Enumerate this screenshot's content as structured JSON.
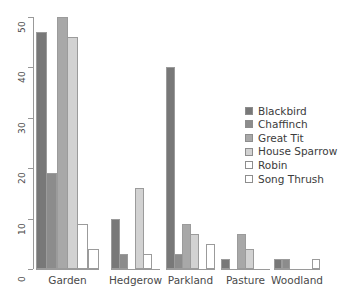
{
  "chart_data": {
    "type": "bar",
    "title": "",
    "subtitle": "",
    "xlabel": "",
    "ylabel": "",
    "categories": [
      "Garden",
      "Hedgerow",
      "Parkland",
      "Pasture",
      "Woodland"
    ],
    "series": [
      {
        "name": "Blackbird",
        "color": "#787878",
        "values": [
          47,
          10,
          40,
          2,
          2
        ]
      },
      {
        "name": "Chaffinch",
        "color": "#8c8c8c",
        "values": [
          19,
          3,
          3,
          0,
          2
        ]
      },
      {
        "name": "Great Tit",
        "color": "#a8a8a8",
        "values": [
          50,
          0,
          9,
          7,
          0
        ]
      },
      {
        "name": "House Sparrow",
        "color": "#d2d2d2",
        "values": [
          46,
          16,
          7,
          4,
          0
        ]
      },
      {
        "name": "Robin",
        "color": "#ffffff",
        "values": [
          9,
          3,
          0,
          0,
          0
        ]
      },
      {
        "name": "Song Thrush",
        "color": "#ffffff",
        "values": [
          4,
          0,
          5,
          0,
          2
        ]
      }
    ],
    "ylim": [
      0,
      50
    ],
    "yticks": [
      0,
      10,
      20,
      30,
      40,
      50
    ],
    "ytick_labels": [
      "0",
      "10",
      "20",
      "30",
      "40",
      "50"
    ],
    "grid": false,
    "legend_position": "right-middle",
    "legend_entries": [
      "Blackbird",
      "Chaffinch",
      "Great Tit",
      "House Sparrow",
      "Robin",
      "Song Thrush"
    ],
    "axis_color": "#999999",
    "bar_border_color": "#9b9b9b"
  }
}
